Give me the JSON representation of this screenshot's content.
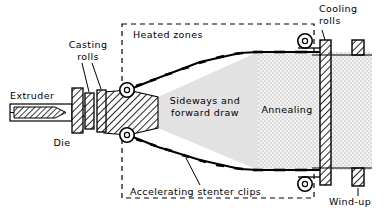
{
  "figure": {
    "type": "process-schematic",
    "background_color": "#ffffff",
    "line_color": "#000000"
  },
  "labels": {
    "extruder": "Extruder",
    "die": "Die",
    "casting_rolls_line1": "Casting",
    "casting_rolls_line2": "rolls",
    "heated_zones": "Heated zones",
    "draw_line1": "Sideways and",
    "draw_line2": "forward draw",
    "annealing": "Annealing",
    "stenter_clips": "Accelerating stenter clips",
    "cooling_rolls_line1": "Cooling",
    "cooling_rolls_line2": "rolls",
    "wind_up": "Wind-up"
  },
  "zones": {
    "draw_zone_fill": "#e2e2e2",
    "annealing_zone_fill": "#ededed",
    "hatch_fill": "#ffffff"
  },
  "stenter_clip_counts": {
    "upper": 10,
    "lower": 10
  },
  "rollers": {
    "sprocket_upper_left": {
      "cx": 127,
      "cy": 90
    },
    "sprocket_lower_left": {
      "cx": 127,
      "cy": 135
    },
    "sprocket_upper_right": {
      "cx": 305,
      "cy": 41
    },
    "sprocket_lower_right": {
      "cx": 305,
      "cy": 184
    }
  }
}
